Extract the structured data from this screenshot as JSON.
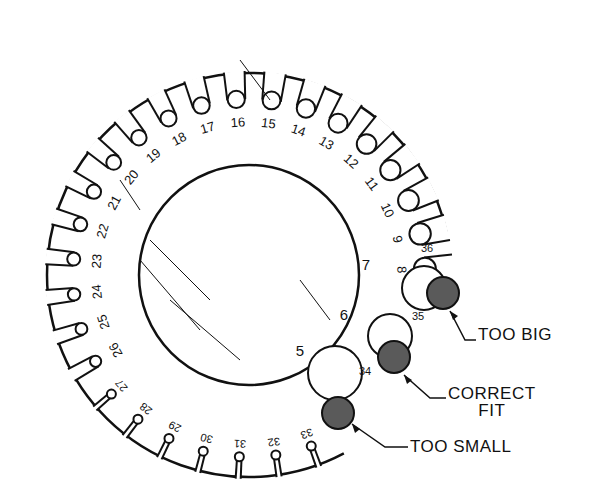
{
  "figure": {
    "colors": {
      "line": "#111111",
      "wire_fill": "#5a5a5a",
      "background": "#ffffff"
    },
    "large_slots": [
      "5",
      "6",
      "7",
      "8",
      "9",
      "10",
      "11",
      "12",
      "13",
      "14",
      "15",
      "16",
      "17",
      "18",
      "19",
      "20",
      "21",
      "22",
      "23",
      "24",
      "25",
      "26"
    ],
    "small_slots": [
      "27",
      "28",
      "29",
      "30",
      "31",
      "32",
      "33",
      "34",
      "35",
      "36"
    ],
    "callouts": {
      "too_big": "TOO BIG",
      "correct_fit_line1": "CORRECT",
      "correct_fit_line2": "FIT",
      "too_small": "TOO SMALL"
    }
  }
}
